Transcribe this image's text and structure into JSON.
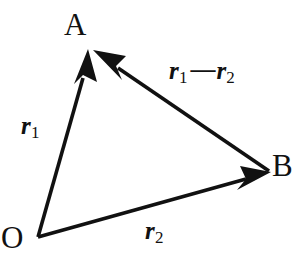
{
  "diagram": {
    "kind": "vector-triangle",
    "background_color": "#ffffff",
    "stroke_color": "#111111",
    "text_color": "#111111",
    "points": {
      "o": {
        "label": "O",
        "x": 38,
        "y": 237
      },
      "a": {
        "label": "A",
        "x": 91,
        "y": 50
      },
      "b": {
        "label": "B",
        "x": 269,
        "y": 171
      }
    },
    "vectors": [
      {
        "name": "r1",
        "from": "o",
        "to": "a",
        "label_r": "r",
        "label_sub": "1",
        "arrowhead_at": "to"
      },
      {
        "name": "r2",
        "from": "o",
        "to": "b",
        "label_r": "r",
        "label_sub": "2",
        "arrowhead_at": "to"
      },
      {
        "name": "r1_minus_r2",
        "from": "b",
        "to": "a",
        "label_r": "r",
        "label_sub": "1",
        "label_operator": "—",
        "label_r_second": "r",
        "label_sub_second": "2",
        "arrowhead_at": "to"
      }
    ],
    "labels": {
      "point_a": "A",
      "point_b": "B",
      "point_o": "O",
      "vector_r1_base": "r",
      "vector_r1_sub": "1",
      "vector_r2_base": "r",
      "vector_r2_sub": "2",
      "vector_diff_base_1": "r",
      "vector_diff_sub_1": "1",
      "vector_diff_operator": "—",
      "vector_diff_base_2": "r",
      "vector_diff_sub_2": "2"
    }
  }
}
